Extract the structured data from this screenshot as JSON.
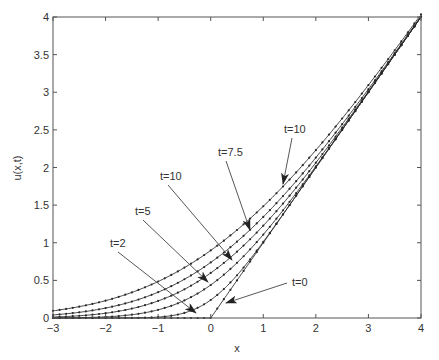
{
  "chart_data": {
    "type": "line",
    "title": "",
    "xlabel": "x",
    "ylabel": "u(x,t)",
    "xlim": [
      -3,
      4
    ],
    "ylim": [
      0,
      4
    ],
    "grid": false,
    "legend": "none",
    "x_ticks": [
      "-3",
      "-2",
      "-1",
      "0",
      "1",
      "2",
      "3",
      "4"
    ],
    "y_ticks": [
      "0",
      "0.5",
      "1",
      "1.5",
      "2",
      "2.5",
      "3",
      "3.5",
      "4"
    ],
    "x": [
      -3,
      -2.75,
      -2.5,
      -2.25,
      -2,
      -1.75,
      -1.5,
      -1.25,
      -1,
      -0.75,
      -0.5,
      -0.25,
      0,
      0.25,
      0.5,
      0.75,
      1,
      1.25,
      1.5,
      1.75,
      2,
      2.25,
      2.5,
      2.75,
      3,
      3.25,
      3.5,
      3.75,
      4
    ],
    "series": [
      {
        "name": "t=0",
        "sigma": 0,
        "values": [
          0,
          0,
          0,
          0,
          0,
          0,
          0,
          0,
          0,
          0,
          0,
          0,
          0,
          0.25,
          0.5,
          0.75,
          1,
          1.25,
          1.5,
          1.75,
          2,
          2.25,
          2.5,
          2.75,
          3,
          3.25,
          3.5,
          3.75,
          4
        ]
      },
      {
        "name": "t=2",
        "sigma": 0.6,
        "values": [
          0,
          0,
          0,
          0,
          0,
          0,
          0,
          0.002,
          0.011,
          0.037,
          0.098,
          0.196,
          0.239,
          0.377,
          0.578,
          0.797,
          1.026,
          1.259,
          1.502,
          1.75,
          2,
          2.25,
          2.5,
          2.75,
          3,
          3.25,
          3.5,
          3.75,
          4
        ]
      },
      {
        "name": "t=5",
        "sigma": 1.1,
        "values": [
          0,
          0,
          0,
          0,
          0.006,
          0.014,
          0.03,
          0.058,
          0.104,
          0.174,
          0.273,
          0.404,
          0.439,
          0.585,
          0.758,
          0.953,
          1.167,
          1.396,
          1.608,
          1.838,
          2.07,
          2.304,
          2.538,
          2.772,
          3.004,
          3.238,
          3.503,
          3.75,
          4
        ]
      },
      {
        "name": "t=7.5",
        "sigma": 1.5,
        "values": [
          0,
          0.002,
          0.004,
          0.009,
          0.018,
          0.032,
          0.054,
          0.087,
          0.133,
          0.195,
          0.276,
          0.376,
          0.598,
          0.63,
          0.782,
          0.95,
          1.135,
          1.335,
          1.549,
          1.776,
          2.013,
          2.226,
          2.46,
          2.695,
          2.938,
          3.192,
          3.455,
          3.726,
          4
        ]
      },
      {
        "name": "t=10 (mid)",
        "sigma": 1.85,
        "values": [
          0.006,
          0.01,
          0.016,
          0.026,
          0.041,
          0.062,
          0.092,
          0.132,
          0.184,
          0.25,
          0.332,
          0.431,
          0.738,
          0.688,
          0.827,
          0.982,
          1.151,
          1.336,
          1.535,
          1.748,
          1.974,
          2.195,
          2.424,
          2.66,
          2.901,
          3.147,
          3.397,
          3.65,
          4
        ]
      },
      {
        "name": "t=10 (top)",
        "sigma": 2.25,
        "values": [
          0.022,
          0.031,
          0.044,
          0.061,
          0.083,
          0.111,
          0.146,
          0.189,
          0.241,
          0.303,
          0.376,
          0.461,
          0.898,
          0.665,
          0.787,
          0.921,
          1.068,
          1.226,
          1.397,
          1.579,
          1.772,
          1.976,
          2.189,
          2.411,
          2.641,
          2.877,
          3.119,
          3.367,
          4
        ]
      }
    ],
    "annotations": [
      {
        "text": "t=10",
        "label_xy": [
          284,
          133
        ],
        "arrow_to": [
          283,
          184
        ]
      },
      {
        "text": "t=7.5",
        "label_xy": [
          218,
          156
        ],
        "arrow_to": [
          250,
          230
        ]
      },
      {
        "text": "t=10",
        "label_xy": [
          160,
          180
        ],
        "arrow_to": [
          232,
          260
        ]
      },
      {
        "text": "t=5",
        "label_xy": [
          135,
          215
        ],
        "arrow_to": [
          208,
          282
        ]
      },
      {
        "text": "t=2",
        "label_xy": [
          110,
          247
        ],
        "arrow_to": [
          196,
          313
        ]
      },
      {
        "text": "t=0",
        "label_xy": [
          292,
          286
        ],
        "arrow_to": [
          226,
          303
        ]
      }
    ],
    "colors": {
      "line": "#2a2a2a",
      "axis": "#555555",
      "arrow": "#444444"
    }
  }
}
